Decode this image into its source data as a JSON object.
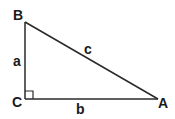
{
  "diagram": {
    "type": "right-triangle",
    "vertices": {
      "B": {
        "label": "B",
        "x": 25,
        "y": 22
      },
      "C": {
        "label": "C",
        "x": 25,
        "y": 99
      },
      "A": {
        "label": "A",
        "x": 158,
        "y": 99
      }
    },
    "sides": {
      "a": {
        "label": "a",
        "between": [
          "B",
          "C"
        ]
      },
      "b": {
        "label": "b",
        "between": [
          "C",
          "A"
        ]
      },
      "c": {
        "label": "c",
        "between": [
          "B",
          "A"
        ]
      }
    },
    "right_angle_at": "C",
    "line_color": "#2a2a2a"
  }
}
